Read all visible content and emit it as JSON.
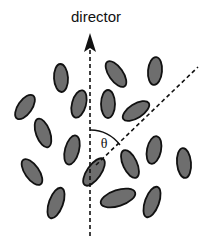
{
  "diagram": {
    "title_label": "director",
    "angle_label": "θ",
    "colors": {
      "background": "#ffffff",
      "molecule_fill": "#6e6e6e",
      "molecule_stroke": "#111111",
      "line": "#111111"
    },
    "director_axis": {
      "x": 90,
      "y_top": 36,
      "y_bottom": 236,
      "arrow": "up",
      "style": "dashed"
    },
    "tilted_axis": {
      "x1": 96,
      "y1": 165,
      "x2": 198,
      "y2": 67,
      "style": "dashed"
    },
    "angle_arc": {
      "cx": 90,
      "cy": 168,
      "r": 32,
      "from_deg": -90,
      "to_deg": -45
    },
    "molecules": [
      {
        "cx": 61,
        "cy": 78,
        "rx": 7,
        "ry": 14,
        "rot": -3
      },
      {
        "cx": 116,
        "cy": 74,
        "rx": 7,
        "ry": 15,
        "rot": -35
      },
      {
        "cx": 155,
        "cy": 71,
        "rx": 7,
        "ry": 14,
        "rot": 5
      },
      {
        "cx": 79,
        "cy": 104,
        "rx": 7,
        "ry": 14,
        "rot": 15
      },
      {
        "cx": 108,
        "cy": 104,
        "rx": 7,
        "ry": 14,
        "rot": 0
      },
      {
        "cx": 136,
        "cy": 111,
        "rx": 7,
        "ry": 15,
        "rot": 58
      },
      {
        "cx": 25,
        "cy": 107,
        "rx": 7,
        "ry": 14,
        "rot": 35
      },
      {
        "cx": 43,
        "cy": 133,
        "rx": 7,
        "ry": 15,
        "rot": -20
      },
      {
        "cx": 72,
        "cy": 150,
        "rx": 7,
        "ry": 15,
        "rot": 15
      },
      {
        "cx": 154,
        "cy": 150,
        "rx": 7,
        "ry": 14,
        "rot": 12
      },
      {
        "cx": 184,
        "cy": 163,
        "rx": 7,
        "ry": 15,
        "rot": -5
      },
      {
        "cx": 32,
        "cy": 172,
        "rx": 7,
        "ry": 15,
        "rot": -35
      },
      {
        "cx": 94,
        "cy": 172,
        "rx": 7,
        "ry": 16,
        "rot": 35
      },
      {
        "cx": 130,
        "cy": 164,
        "rx": 7,
        "ry": 15,
        "rot": -25
      },
      {
        "cx": 56,
        "cy": 203,
        "rx": 7,
        "ry": 16,
        "rot": 20
      },
      {
        "cx": 118,
        "cy": 198,
        "rx": 8,
        "ry": 18,
        "rot": 72
      },
      {
        "cx": 152,
        "cy": 202,
        "rx": 7,
        "ry": 16,
        "rot": 20
      }
    ]
  }
}
